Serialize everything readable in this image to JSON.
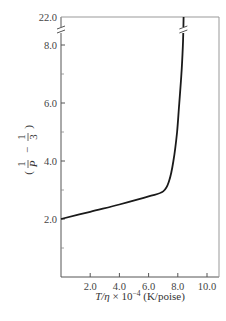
{
  "chart_data": {
    "type": "line",
    "title": "",
    "xlabel": "T/η × 10^-4 (K/poise)",
    "xlabel_parts": {
      "italic": "T/η",
      "rest": " × 10",
      "sup": "−4",
      "unit": " (K/poise)"
    },
    "ylabel": "(1/P − 1/3)",
    "xlim": [
      0,
      10.8
    ],
    "ylim": [
      0,
      22.0
    ],
    "y_axis_break": {
      "between": [
        8.9,
        22.0
      ]
    },
    "x_ticks": [
      2.0,
      4.0,
      6.0,
      8.0,
      10.0
    ],
    "x_tick_labels": [
      "2.0",
      "4.0",
      "6.0",
      "8.0",
      "10.0"
    ],
    "y_ticks": [
      2.0,
      4.0,
      6.0,
      8.0,
      22.0
    ],
    "y_tick_labels": [
      "2.0",
      "4.0",
      "6.0",
      "8.0",
      "22.0"
    ],
    "y_minor_ticks": [
      1.0,
      3.0,
      5.0,
      7.0
    ],
    "x_minor_ticks": [],
    "grid": false,
    "legend": null,
    "series": [
      {
        "name": "curve",
        "x": [
          0.0,
          2.0,
          4.0,
          6.0,
          7.0,
          7.4,
          7.7,
          7.95,
          8.1,
          8.25,
          8.35,
          8.4
        ],
        "y": [
          2.0,
          2.25,
          2.5,
          2.78,
          2.95,
          3.3,
          4.0,
          5.0,
          6.0,
          7.0,
          8.0,
          22.0
        ]
      }
    ]
  },
  "colors": {
    "axis": "#555555",
    "line": "#1a1a1a",
    "text": "#444444"
  }
}
